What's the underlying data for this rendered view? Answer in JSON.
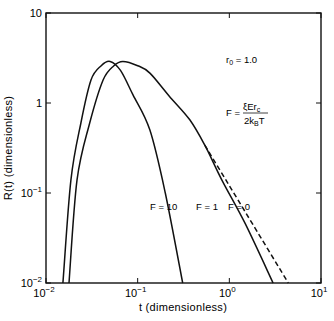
{
  "chart_data": {
    "type": "line",
    "title": "",
    "xlabel": "t (dimensionless)",
    "ylabel": "R(t) (dimensionless)",
    "xscale": "log",
    "yscale": "log",
    "xlim": [
      0.01,
      10
    ],
    "ylim": [
      0.01,
      10
    ],
    "grid": false,
    "x_ticks": [
      {
        "value": 0.01,
        "base": "10",
        "exp": "−2"
      },
      {
        "value": 0.1,
        "base": "10",
        "exp": "−1"
      },
      {
        "value": 1,
        "base": "10",
        "exp": "0"
      },
      {
        "value": 10,
        "base": "10",
        "exp": "1"
      }
    ],
    "y_ticks": [
      {
        "value": 0.01,
        "base": "10",
        "exp": "−2"
      },
      {
        "value": 0.1,
        "base": "10",
        "exp": "−1"
      },
      {
        "value": 1,
        "base": "1",
        "exp": ""
      },
      {
        "value": 10,
        "base": "10",
        "exp": ""
      }
    ],
    "series": [
      {
        "name": "F = 10",
        "style": "solid",
        "points": [
          [
            0.0153,
            0.01
          ],
          [
            0.0187,
            0.139
          ],
          [
            0.024,
            0.6
          ],
          [
            0.031,
            1.8
          ],
          [
            0.04,
            2.6
          ],
          [
            0.05,
            2.9
          ],
          [
            0.065,
            2.3
          ],
          [
            0.089,
            1.23
          ],
          [
            0.136,
            0.5
          ],
          [
            0.2,
            0.1
          ],
          [
            0.31,
            0.01
          ]
        ]
      },
      {
        "name": "F = 1",
        "style": "solid",
        "points": [
          [
            0.0178,
            0.01
          ],
          [
            0.0218,
            0.139
          ],
          [
            0.03,
            0.6
          ],
          [
            0.042,
            1.8
          ],
          [
            0.055,
            2.6
          ],
          [
            0.069,
            2.9
          ],
          [
            0.1,
            2.6
          ],
          [
            0.136,
            2.15
          ],
          [
            0.22,
            1.2
          ],
          [
            0.37,
            0.65
          ],
          [
            0.54,
            0.34
          ],
          [
            0.83,
            0.139
          ],
          [
            1.5,
            0.045
          ],
          [
            3.0,
            0.01
          ]
        ]
      },
      {
        "name": "F = 0",
        "style": "dashed",
        "points": [
          [
            0.54,
            0.34
          ],
          [
            0.92,
            0.139
          ],
          [
            1.8,
            0.045
          ],
          [
            4.4,
            0.01
          ]
        ]
      }
    ],
    "annotations": [
      {
        "text": "F = 10",
        "x": 0.16,
        "y": 0.31
      },
      {
        "text": "F = 1",
        "x": 0.5,
        "y": 0.31
      },
      {
        "text": "F = 0",
        "x": 0.95,
        "y": 0.31
      },
      {
        "text": "r0 = 1.0",
        "x": 1.6,
        "y": 2.6
      },
      {
        "text": "F = ξErc / 2kBT",
        "x": 1.6,
        "y": 0.8
      }
    ]
  },
  "labels": {
    "xlabel": "t (dimensionless)",
    "ylabel": "R(t) (dimensionless)",
    "f10": "F = 10",
    "f1": "F = 1",
    "f0": "F = 0",
    "r0_main": "r",
    "r0_sub": "0",
    "r0_val": " = 1.0",
    "formula_lhs": "F =",
    "formula_num": "ξEr",
    "formula_num_sub": "c",
    "formula_den_a": "2k",
    "formula_den_sub": "B",
    "formula_den_b": "T"
  }
}
